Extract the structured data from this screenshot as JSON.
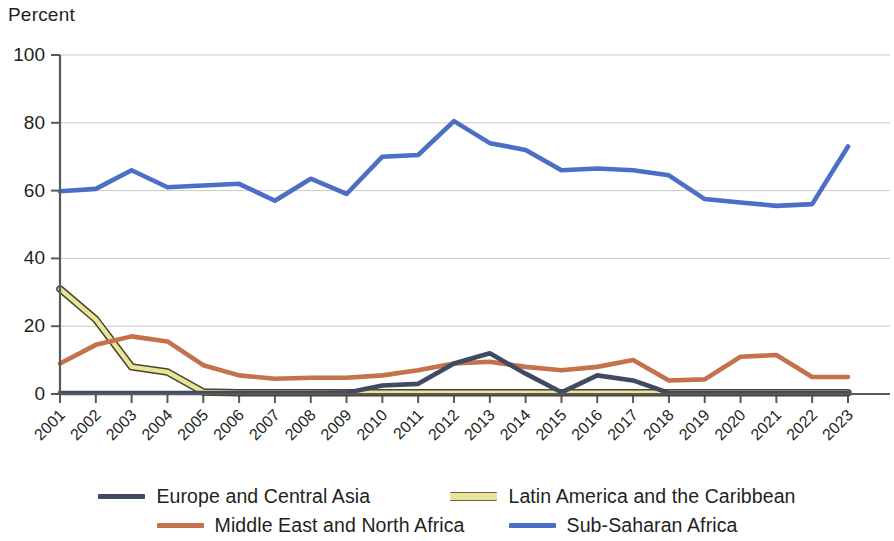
{
  "chart_data": {
    "type": "line",
    "title": "",
    "subtitle": "",
    "ylabel": "Percent",
    "xlabel": "",
    "ylim": [
      0,
      100
    ],
    "yticks": [
      0,
      20,
      40,
      60,
      80,
      100
    ],
    "grid": true,
    "legend_position": "bottom",
    "categories": [
      "2001",
      "2002",
      "2003",
      "2004",
      "2005",
      "2006",
      "2007",
      "2008",
      "2009",
      "2010",
      "2011",
      "2012",
      "2013",
      "2014",
      "2015",
      "2016",
      "2017",
      "2018",
      "2019",
      "2020",
      "2021",
      "2022",
      "2023"
    ],
    "series": [
      {
        "name": "Europe and Central Asia",
        "color": "#404a63",
        "values": [
          0.3,
          0.3,
          0.3,
          0.3,
          0.3,
          0.3,
          0.3,
          0.3,
          0.4,
          2.5,
          3.0,
          9.0,
          12.0,
          6.0,
          0.5,
          5.5,
          4.0,
          0.3,
          0.3,
          0.3,
          0.3,
          0.3,
          0.3
        ]
      },
      {
        "name": "Middle East and North Africa",
        "color": "#c5714b",
        "values": [
          9.0,
          14.5,
          17.0,
          15.5,
          8.5,
          5.5,
          4.5,
          4.8,
          4.8,
          5.5,
          7.0,
          9.0,
          9.5,
          8.0,
          7.0,
          8.0,
          10.0,
          4.0,
          4.3,
          11.0,
          11.5,
          5.0,
          5.0
        ]
      },
      {
        "name": "Latin America and the Caribbean",
        "color": "#e8e59a",
        "outline": "#4a4528",
        "values": [
          31.0,
          22.0,
          8.0,
          6.5,
          0.6,
          0.4,
          0.4,
          0.4,
          0.4,
          0.4,
          0.4,
          0.4,
          0.4,
          0.4,
          0.4,
          0.4,
          0.4,
          0.4,
          0.4,
          0.4,
          0.4,
          0.4,
          0.4
        ]
      },
      {
        "name": "Sub-Saharan Africa",
        "color": "#4a6fc4",
        "values": [
          59.8,
          60.5,
          66.0,
          61.0,
          61.5,
          62.0,
          57.0,
          63.5,
          59.0,
          70.0,
          70.5,
          80.5,
          74.0,
          72.0,
          66.0,
          66.5,
          66.0,
          64.5,
          57.5,
          56.5,
          55.5,
          56.0,
          73.0
        ]
      }
    ]
  },
  "legend": {
    "items": [
      {
        "label": "Europe and Central Asia"
      },
      {
        "label": "Latin America and the Caribbean"
      },
      {
        "label": "Middle East and North Africa"
      },
      {
        "label": "Sub-Saharan Africa"
      }
    ]
  }
}
